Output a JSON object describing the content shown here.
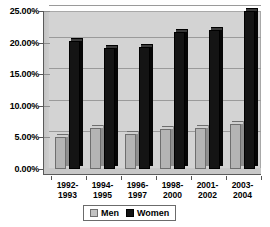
{
  "chart_data": {
    "type": "bar",
    "title": "",
    "xlabel": "",
    "ylabel": "",
    "categories": [
      "1992-1993",
      "1994-1995",
      "1996-1997",
      "1998-2000",
      "2001-2002",
      "2003-2004"
    ],
    "category_lines": [
      [
        "1992-",
        "1993"
      ],
      [
        "1994-",
        "1995"
      ],
      [
        "1996-",
        "1997"
      ],
      [
        "1998-",
        "2000"
      ],
      [
        "2001-",
        "2002"
      ],
      [
        "2003-",
        "2004"
      ]
    ],
    "series": [
      {
        "name": "Men",
        "color": "#b4b4b4",
        "values": [
          5.1,
          6.5,
          5.5,
          6.3,
          6.5,
          7.2
        ]
      },
      {
        "name": "Women",
        "color": "#141414",
        "values": [
          20.3,
          19.2,
          19.3,
          21.7,
          22.0,
          25.0
        ]
      }
    ],
    "ylim": [
      0,
      25
    ],
    "ytick_values": [
      0,
      5,
      10,
      15,
      20,
      25
    ],
    "ytick_labels": [
      "0.00%",
      "5.00%",
      "10.00%",
      "15.00%",
      "20.00%",
      "25.00%"
    ],
    "grid": true,
    "legend_position": "bottom-center",
    "legend_entries": [
      "Men",
      "Women"
    ]
  }
}
